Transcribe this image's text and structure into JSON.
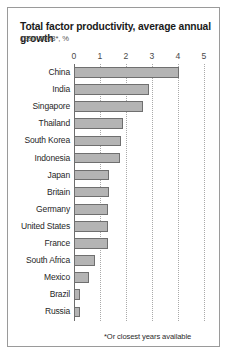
{
  "chart": {
    "title": "Total factor productivity, average annual growth",
    "subtitle": "1990-2008*, %",
    "footnote": "*Or closest years available"
  },
  "chart_data": {
    "type": "bar",
    "orientation": "horizontal",
    "title": "Total factor productivity, average annual growth",
    "subtitle": "1990-2008*, %",
    "xlabel": "",
    "ylabel": "",
    "xlim": [
      0,
      5
    ],
    "xticks": [
      0,
      1,
      2,
      3,
      4,
      5
    ],
    "xtick_labels": [
      "0",
      "1",
      "2",
      "3",
      "4",
      "5"
    ],
    "grid": "vertical-dotted",
    "legend": "none",
    "annotations": [
      "*Or closest years available"
    ],
    "bar_color": "#b4b4b4",
    "bar_edge_color": "#6f6f6f",
    "categories": [
      "China",
      "India",
      "Singapore",
      "Thailand",
      "South Korea",
      "Indonesia",
      "Japan",
      "Britain",
      "Germany",
      "United States",
      "France",
      "South Africa",
      "Mexico",
      "Brazil",
      "Russia"
    ],
    "values": [
      4.05,
      2.9,
      2.65,
      1.9,
      1.8,
      1.75,
      1.35,
      1.35,
      1.3,
      1.3,
      1.3,
      0.8,
      0.58,
      0.22,
      0.22
    ]
  }
}
